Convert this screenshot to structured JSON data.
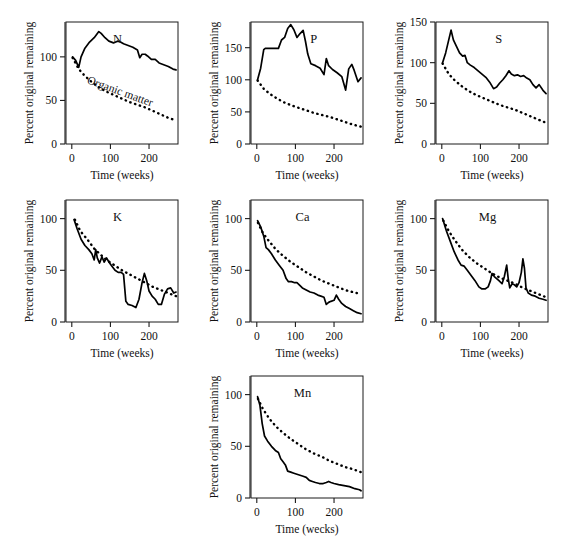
{
  "page": {
    "bleed_text": ""
  },
  "figure": {
    "name": "nutrient-decomposition-panels",
    "common": {
      "xlabel": "Time (weeks)",
      "ylabel": "Percent original remaining",
      "xticks": [
        0,
        100,
        200
      ],
      "xticklabels": [
        "0",
        "100",
        "200"
      ],
      "xlim": [
        -15,
        275
      ],
      "organic_matter_label": "Organic matter"
    },
    "panels": [
      {
        "key": "N",
        "label": "N",
        "xlabel": "Time (weeks)",
        "ylabel": "Percent original remaining",
        "ylim": [
          0,
          140
        ],
        "yticks": [
          0,
          50,
          100
        ],
        "yticklabels": [
          "0",
          "50",
          "100"
        ],
        "show_om_label": true
      },
      {
        "key": "P",
        "label": "P",
        "xlabel": "Time (weeks)",
        "ylabel": "Percent original remaining",
        "ylim": [
          0,
          190
        ],
        "yticks": [
          0,
          50,
          100,
          150
        ],
        "yticklabels": [
          "0",
          "50",
          "100",
          "150"
        ],
        "show_om_label": false
      },
      {
        "key": "S",
        "label": "S",
        "xlabel": "Time (weeks)",
        "ylabel": "Percent original remaining",
        "ylim": [
          0,
          150
        ],
        "yticks": [
          0,
          50,
          100,
          150
        ],
        "yticklabels": [
          "0",
          "50",
          "100",
          "150"
        ],
        "show_om_label": false
      },
      {
        "key": "K",
        "label": "K",
        "xlabel": "Time (weeks)",
        "ylabel": "Percent original remaining",
        "ylim": [
          0,
          118
        ],
        "yticks": [
          0,
          50,
          100
        ],
        "yticklabels": [
          "0",
          "50",
          "100"
        ],
        "show_om_label": false
      },
      {
        "key": "Ca",
        "label": "Ca",
        "xlabel": "Time (weeks)",
        "ylabel": "Percent original remaining",
        "ylim": [
          0,
          118
        ],
        "yticks": [
          0,
          50,
          100
        ],
        "yticklabels": [
          "0",
          "50",
          "100"
        ],
        "show_om_label": false
      },
      {
        "key": "Mg",
        "label": "Mg",
        "xlabel": "Time (weeks)",
        "ylabel": "Percent original remaining",
        "ylim": [
          0,
          118
        ],
        "yticks": [
          0,
          50,
          100
        ],
        "yticklabels": [
          "0",
          "50",
          "100"
        ],
        "show_om_label": false
      },
      {
        "key": "Mn",
        "label": "Mn",
        "xlabel": "Time (wecks)",
        "ylabel": "Percent original remaining",
        "ylim": [
          0,
          118
        ],
        "yticks": [
          0,
          50,
          100
        ],
        "yticklabels": [
          "0",
          "50",
          "100"
        ],
        "show_om_label": false
      }
    ]
  },
  "chart_data": [
    {
      "type": "line",
      "title": "N",
      "xlabel": "Time (weeks)",
      "ylabel": "Percent original remaining",
      "xlim": [
        -15,
        275
      ],
      "ylim": [
        0,
        140
      ],
      "xticks": [
        0,
        100,
        200
      ],
      "yticks": [
        0,
        50,
        100
      ],
      "grid": false,
      "legend": "none",
      "series": [
        {
          "name": "N",
          "style": "solid",
          "x": [
            2,
            10,
            18,
            24,
            34,
            46,
            58,
            70,
            76,
            86,
            96,
            108,
            118,
            126,
            134,
            146,
            158,
            170,
            176,
            182,
            190,
            196,
            206,
            216,
            226,
            238,
            250,
            262,
            270
          ],
          "y": [
            100,
            96,
            88,
            100,
            110,
            117,
            122,
            129,
            127,
            122,
            118,
            116,
            118,
            117,
            115,
            113,
            111,
            108,
            99,
            103,
            103,
            101,
            97,
            97,
            93,
            91,
            89,
            86,
            85
          ]
        },
        {
          "name": "Organic matter",
          "style": "dashed",
          "x": [
            2,
            18,
            34,
            52,
            70,
            90,
            110,
            130,
            150,
            170,
            190,
            210,
            230,
            250,
            270
          ],
          "y": [
            99,
            86,
            78,
            71,
            65,
            60,
            56,
            52,
            48,
            45,
            42,
            38,
            34,
            30,
            27
          ]
        }
      ]
    },
    {
      "type": "line",
      "title": "P",
      "xlabel": "Time (weeks)",
      "ylabel": "Percent original remaining",
      "xlim": [
        -15,
        275
      ],
      "ylim": [
        0,
        190
      ],
      "xticks": [
        0,
        100,
        200
      ],
      "yticks": [
        0,
        50,
        100,
        150
      ],
      "grid": false,
      "legend": "none",
      "series": [
        {
          "name": "P",
          "style": "solid",
          "x": [
            2,
            10,
            18,
            22,
            40,
            56,
            64,
            72,
            80,
            88,
            96,
            104,
            112,
            120,
            126,
            132,
            140,
            152,
            164,
            174,
            180,
            186,
            196,
            208,
            220,
            230,
            238,
            246,
            252,
            262,
            270
          ],
          "y": [
            100,
            118,
            147,
            149,
            149,
            149,
            162,
            166,
            180,
            186,
            178,
            166,
            172,
            177,
            160,
            140,
            125,
            122,
            118,
            108,
            133,
            122,
            116,
            111,
            105,
            84,
            117,
            124,
            115,
            97,
            103
          ]
        },
        {
          "name": "Organic matter",
          "style": "dashed",
          "x": [
            2,
            18,
            34,
            52,
            70,
            90,
            110,
            130,
            150,
            170,
            190,
            210,
            230,
            250,
            270
          ],
          "y": [
            99,
            86,
            78,
            71,
            65,
            60,
            56,
            52,
            48,
            45,
            42,
            38,
            34,
            30,
            27
          ]
        }
      ]
    },
    {
      "type": "line",
      "title": "S",
      "xlabel": "Time (weeks)",
      "ylabel": "Percent original remaining",
      "xlim": [
        -15,
        275
      ],
      "ylim": [
        0,
        150
      ],
      "xticks": [
        0,
        100,
        200
      ],
      "yticks": [
        0,
        50,
        100,
        150
      ],
      "grid": false,
      "legend": "none",
      "series": [
        {
          "name": "S",
          "style": "solid",
          "x": [
            2,
            10,
            18,
            24,
            30,
            38,
            46,
            54,
            60,
            66,
            74,
            84,
            94,
            104,
            114,
            124,
            134,
            142,
            150,
            158,
            166,
            174,
            180,
            188,
            196,
            204,
            212,
            220,
            228,
            236,
            244,
            252,
            262,
            270
          ],
          "y": [
            100,
            112,
            128,
            140,
            128,
            120,
            112,
            108,
            109,
            100,
            97,
            94,
            90,
            86,
            82,
            76,
            68,
            70,
            75,
            79,
            84,
            90,
            86,
            84,
            85,
            83,
            84,
            81,
            79,
            73,
            69,
            73,
            66,
            62
          ]
        },
        {
          "name": "Organic matter",
          "style": "dashed",
          "x": [
            2,
            18,
            34,
            52,
            70,
            90,
            110,
            130,
            150,
            170,
            190,
            210,
            230,
            250,
            270
          ],
          "y": [
            99,
            86,
            78,
            71,
            65,
            60,
            56,
            52,
            48,
            45,
            42,
            38,
            34,
            30,
            26
          ]
        }
      ]
    },
    {
      "type": "line",
      "title": "K",
      "xlabel": "Time (weeks)",
      "ylabel": "Percent original remaining",
      "xlim": [
        -15,
        275
      ],
      "ylim": [
        0,
        118
      ],
      "xticks": [
        0,
        100,
        200
      ],
      "yticks": [
        0,
        50,
        100
      ],
      "grid": false,
      "legend": "none",
      "series": [
        {
          "name": "K",
          "style": "solid",
          "x": [
            6,
            14,
            24,
            34,
            44,
            52,
            58,
            62,
            66,
            72,
            78,
            84,
            90,
            96,
            104,
            112,
            120,
            128,
            134,
            140,
            146,
            156,
            166,
            174,
            182,
            188,
            194,
            200,
            208,
            216,
            224,
            232,
            240,
            248,
            256,
            264,
            270
          ],
          "y": [
            99,
            90,
            80,
            74,
            70,
            66,
            60,
            70,
            62,
            57,
            63,
            58,
            62,
            58,
            54,
            50,
            48,
            48,
            46,
            20,
            17,
            16,
            14,
            22,
            38,
            47,
            40,
            30,
            25,
            22,
            17,
            17,
            27,
            32,
            33,
            28,
            29
          ]
        },
        {
          "name": "Organic matter",
          "style": "dashed",
          "x": [
            8,
            22,
            40,
            58,
            72,
            90,
            110,
            130,
            150,
            170,
            190,
            210,
            230,
            250,
            270
          ],
          "y": [
            99,
            88,
            80,
            71,
            66,
            60,
            55,
            50,
            46,
            42,
            38,
            34,
            31,
            28,
            25
          ]
        }
      ]
    },
    {
      "type": "line",
      "title": "Ca",
      "xlabel": "Time (weeks)",
      "ylabel": "Percent original remaining",
      "xlim": [
        -15,
        275
      ],
      "ylim": [
        0,
        118
      ],
      "xticks": [
        0,
        100,
        200
      ],
      "yticks": [
        0,
        50,
        100
      ],
      "grid": false,
      "legend": "none",
      "series": [
        {
          "name": "Ca",
          "style": "solid",
          "x": [
            2,
            10,
            18,
            24,
            30,
            38,
            48,
            58,
            68,
            76,
            82,
            90,
            98,
            104,
            110,
            118,
            128,
            138,
            148,
            158,
            166,
            174,
            180,
            186,
            192,
            200,
            206,
            212,
            220,
            230,
            240,
            250,
            260,
            270
          ],
          "y": [
            98,
            92,
            83,
            72,
            70,
            66,
            60,
            55,
            50,
            42,
            39,
            39,
            38,
            38,
            36,
            33,
            31,
            29,
            28,
            26,
            25,
            24,
            17,
            19,
            20,
            21,
            26,
            22,
            18,
            15,
            13,
            11,
            9,
            8
          ]
        },
        {
          "name": "Organic matter",
          "style": "dashed",
          "x": [
            3,
            16,
            32,
            50,
            68,
            88,
            108,
            128,
            148,
            168,
            188,
            208,
            228,
            248,
            270
          ],
          "y": [
            96,
            86,
            78,
            70,
            64,
            58,
            53,
            48,
            44,
            40,
            37,
            34,
            31,
            29,
            27
          ]
        }
      ]
    },
    {
      "type": "line",
      "title": "Mg",
      "xlabel": "Time (weeks)",
      "ylabel": "Percent original remaining",
      "xlim": [
        -15,
        275
      ],
      "ylim": [
        0,
        118
      ],
      "xticks": [
        0,
        100,
        200
      ],
      "yticks": [
        0,
        50,
        100
      ],
      "grid": false,
      "legend": "none",
      "series": [
        {
          "name": "Mg",
          "style": "solid",
          "x": [
            2,
            12,
            22,
            32,
            42,
            50,
            58,
            66,
            76,
            86,
            96,
            104,
            112,
            120,
            126,
            130,
            136,
            142,
            148,
            156,
            162,
            168,
            172,
            176,
            182,
            188,
            194,
            200,
            206,
            210,
            214,
            218,
            224,
            232,
            242,
            252,
            262,
            270
          ],
          "y": [
            100,
            88,
            78,
            68,
            60,
            55,
            54,
            50,
            45,
            40,
            34,
            32,
            32,
            34,
            40,
            47,
            44,
            42,
            40,
            37,
            44,
            55,
            42,
            33,
            37,
            36,
            34,
            38,
            48,
            61,
            52,
            33,
            28,
            26,
            25,
            23,
            22,
            21
          ]
        },
        {
          "name": "Organic matter",
          "style": "dashed",
          "x": [
            4,
            18,
            34,
            52,
            70,
            90,
            110,
            130,
            150,
            170,
            190,
            210,
            230,
            250,
            270
          ],
          "y": [
            98,
            88,
            79,
            70,
            63,
            57,
            52,
            47,
            43,
            40,
            37,
            33,
            30,
            27,
            24
          ]
        }
      ]
    },
    {
      "type": "line",
      "title": "Mn",
      "xlabel": "Time (wecks)",
      "ylabel": "Percent original remaining",
      "xlim": [
        -15,
        275
      ],
      "ylim": [
        0,
        118
      ],
      "xticks": [
        0,
        100,
        200
      ],
      "yticks": [
        0,
        50,
        100
      ],
      "grid": false,
      "legend": "none",
      "series": [
        {
          "name": "Mn",
          "style": "solid",
          "x": [
            2,
            8,
            14,
            20,
            28,
            38,
            48,
            56,
            62,
            68,
            74,
            80,
            88,
            96,
            104,
            112,
            120,
            128,
            136,
            144,
            152,
            162,
            172,
            180,
            186,
            192,
            200,
            212,
            226,
            240,
            254,
            266,
            270
          ],
          "y": [
            98,
            90,
            72,
            60,
            55,
            50,
            46,
            44,
            38,
            35,
            32,
            26,
            25,
            24,
            23,
            22,
            21,
            20,
            17,
            16,
            15,
            14,
            14,
            15,
            16,
            15,
            14,
            13,
            12,
            11,
            9,
            8,
            7
          ]
        },
        {
          "name": "Organic matter",
          "style": "dashed",
          "x": [
            3,
            16,
            32,
            50,
            68,
            88,
            108,
            128,
            148,
            168,
            188,
            208,
            228,
            248,
            270
          ],
          "y": [
            96,
            86,
            77,
            69,
            63,
            57,
            52,
            47,
            43,
            40,
            36,
            33,
            30,
            28,
            25
          ]
        }
      ]
    }
  ]
}
